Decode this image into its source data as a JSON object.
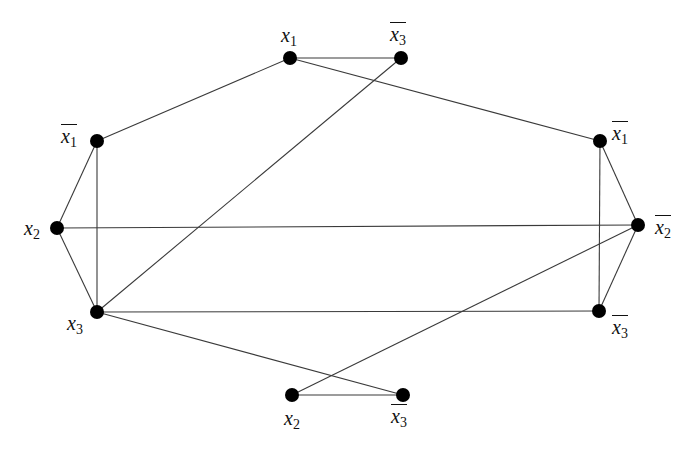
{
  "diagram": {
    "type": "graph",
    "nodes": [
      {
        "id": "top_x1",
        "var": "x",
        "sub": "1",
        "negated": false,
        "x": 290,
        "y": 58,
        "label_x": 281,
        "label_y": 25
      },
      {
        "id": "top_x3n",
        "var": "x",
        "sub": "3",
        "negated": true,
        "x": 401,
        "y": 58,
        "label_x": 390,
        "label_y": 22
      },
      {
        "id": "left_x1n",
        "var": "x",
        "sub": "1",
        "negated": true,
        "x": 97,
        "y": 141,
        "label_x": 61,
        "label_y": 124
      },
      {
        "id": "left_x2",
        "var": "x",
        "sub": "2",
        "negated": false,
        "x": 57,
        "y": 228,
        "label_x": 24,
        "label_y": 218
      },
      {
        "id": "left_x3",
        "var": "x",
        "sub": "3",
        "negated": false,
        "x": 97,
        "y": 312,
        "label_x": 67,
        "label_y": 313
      },
      {
        "id": "right_x1n",
        "var": "x",
        "sub": "1",
        "negated": true,
        "x": 600,
        "y": 141,
        "label_x": 612,
        "label_y": 121
      },
      {
        "id": "right_x2n",
        "var": "x",
        "sub": "2",
        "negated": true,
        "x": 638,
        "y": 225,
        "label_x": 655,
        "label_y": 215
      },
      {
        "id": "right_x3n",
        "var": "x",
        "sub": "3",
        "negated": true,
        "x": 599,
        "y": 311,
        "label_x": 612,
        "label_y": 315
      },
      {
        "id": "bot_x2",
        "var": "x",
        "sub": "2",
        "negated": false,
        "x": 292,
        "y": 395,
        "label_x": 284,
        "label_y": 408
      },
      {
        "id": "bot_x3n",
        "var": "x",
        "sub": "3",
        "negated": true,
        "x": 403,
        "y": 395,
        "label_x": 391,
        "label_y": 404
      }
    ],
    "edges": [
      [
        "top_x1",
        "top_x3n"
      ],
      [
        "top_x1",
        "left_x1n"
      ],
      [
        "top_x1",
        "right_x1n"
      ],
      [
        "top_x3n",
        "left_x3"
      ],
      [
        "left_x1n",
        "left_x2"
      ],
      [
        "left_x1n",
        "left_x3"
      ],
      [
        "left_x2",
        "left_x3"
      ],
      [
        "left_x2",
        "right_x2n"
      ],
      [
        "left_x3",
        "right_x3n"
      ],
      [
        "left_x3",
        "bot_x3n"
      ],
      [
        "right_x1n",
        "right_x2n"
      ],
      [
        "right_x1n",
        "right_x3n"
      ],
      [
        "right_x2n",
        "right_x3n"
      ],
      [
        "right_x2n",
        "bot_x2"
      ],
      [
        "bot_x2",
        "bot_x3n"
      ]
    ],
    "node_radius": 7,
    "colors": {
      "node": "#000000",
      "edge": "#3a3a3a",
      "background": "#ffffff"
    }
  }
}
